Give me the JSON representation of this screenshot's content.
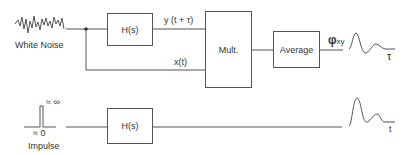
{
  "diagram": {
    "top_path": {
      "source_label": "White Noise",
      "filter_label": "H(s)",
      "output_signal_label": "y (t + τ)",
      "input_signal_label": "x(t)",
      "multiplier_label": "Mult.",
      "average_label": "Average",
      "result_label": "φ",
      "result_subscript": "xy",
      "axis_label": "τ"
    },
    "bottom_path": {
      "source_label": "Impulse",
      "height_label": "≈ ∞",
      "width_label": "≈ 0",
      "filter_label": "H(s)",
      "axis_label": "t"
    }
  }
}
